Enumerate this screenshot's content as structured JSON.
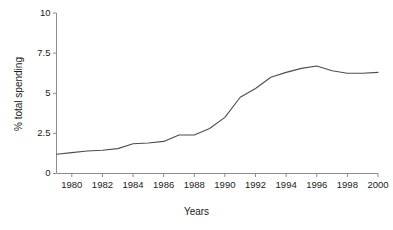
{
  "chart_data": {
    "type": "line",
    "title": "",
    "xlabel": "Years",
    "ylabel": "% total spending",
    "xlim": [
      1979,
      2000
    ],
    "ylim": [
      0,
      10
    ],
    "grid": false,
    "legend": null,
    "line_color": "#4d4d4d",
    "axis_color": "#808080",
    "x_ticks": [
      1980,
      1982,
      1984,
      1986,
      1988,
      1990,
      1992,
      1994,
      1996,
      1998,
      2000
    ],
    "x_tick_labels": [
      "1980",
      "1982",
      "1984",
      "1986",
      "1988",
      "1990",
      "1992",
      "1994",
      "1996",
      "1998",
      "2000"
    ],
    "y_ticks": [
      0,
      2.5,
      5,
      7.5,
      10
    ],
    "y_tick_labels": [
      "0",
      "2.5",
      "5",
      "7.5",
      "10"
    ],
    "series": [
      {
        "name": "% total spending",
        "x": [
          1979,
          1980,
          1981,
          1982,
          1983,
          1984,
          1985,
          1986,
          1987,
          1988,
          1989,
          1990,
          1991,
          1992,
          1993,
          1994,
          1995,
          1996,
          1997,
          1998,
          1999,
          2000
        ],
        "values": [
          1.2,
          1.3,
          1.4,
          1.45,
          1.55,
          1.85,
          1.9,
          2.0,
          2.4,
          2.4,
          2.8,
          3.5,
          4.75,
          5.3,
          6.0,
          6.3,
          6.55,
          6.7,
          6.4,
          6.25,
          6.25,
          6.3
        ]
      }
    ]
  },
  "axes": {
    "y_axis_name": "y-axis",
    "x_axis_name": "x-axis"
  }
}
